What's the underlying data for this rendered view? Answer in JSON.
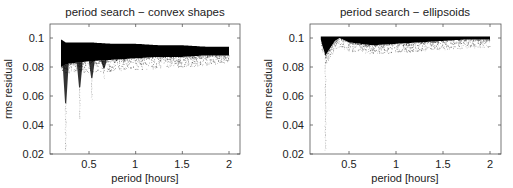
{
  "chart_data": [
    {
      "type": "scatter",
      "title": "period search − convex shapes",
      "xlabel": "period [hours]",
      "ylabel": "rms residual",
      "xlim": [
        0.08,
        2.12
      ],
      "ylim": [
        0.02,
        0.11
      ],
      "xticks": [
        0.5,
        1,
        1.5,
        2
      ],
      "xtick_labels": [
        "0.5",
        "1",
        "1.5",
        "2"
      ],
      "yticks": [
        0.02,
        0.04,
        0.06,
        0.08,
        0.1
      ],
      "ytick_labels": [
        "0.02",
        "0.04",
        "0.06",
        "0.08",
        "0.1"
      ],
      "grid": false,
      "legend": null,
      "marker_color": "#000000",
      "description": "Dense band of points from period 0.2 to 2 h; upper envelope ~0.099 at 0.2 h decreasing to ~0.094 at 2 h; lower edge of dense band ~0.08 at short periods rising to ~0.088 at 2 h; sparse scatter down to ~0.078 along the band; vertical dips (spikes) toward lower rms at ~0.25 h (down to ~0.022), ~0.4 h (~0.045), ~0.52 h (~0.058) and ~0.65 h (~0.072).",
      "band": {
        "x": [
          0.2,
          0.25,
          0.5,
          0.75,
          1.0,
          1.25,
          1.5,
          1.75,
          2.0
        ],
        "upper": [
          0.099,
          0.097,
          0.097,
          0.096,
          0.096,
          0.095,
          0.095,
          0.094,
          0.094
        ],
        "lower": [
          0.08,
          0.082,
          0.084,
          0.085,
          0.086,
          0.087,
          0.087,
          0.088,
          0.088
        ]
      },
      "sparse_floor": [
        0.078,
        0.078,
        0.078,
        0.079,
        0.08,
        0.081,
        0.082,
        0.083,
        0.085
      ],
      "dips": [
        {
          "x": 0.25,
          "min": 0.022
        },
        {
          "x": 0.4,
          "min": 0.045
        },
        {
          "x": 0.53,
          "min": 0.058
        },
        {
          "x": 0.66,
          "min": 0.072
        }
      ]
    },
    {
      "type": "scatter",
      "title": "period search − ellipsoids",
      "xlabel": "period [hours]",
      "ylabel": "rms residual",
      "xlim": [
        0.08,
        2.12
      ],
      "ylim": [
        0.02,
        0.11
      ],
      "xticks": [
        0.5,
        1,
        1.5,
        2
      ],
      "xtick_labels": [
        "0.5",
        "1",
        "1.5",
        "2"
      ],
      "yticks": [
        0.02,
        0.04,
        0.06,
        0.08,
        0.1
      ],
      "ytick_labels": [
        "0.02",
        "0.04",
        "0.06",
        "0.08",
        "0.1"
      ],
      "grid": false,
      "legend": null,
      "marker_color": "#000000",
      "description": "Dense band hugging rms ~0.1 from 0.2 to 2 h; deep narrow dip at ~0.25 h down to ~0.088 (with sparse points to ~0.022); band upper edge ~0.101; lower edge ~0.096 around 0.5-1.0 h converging to ~0.099 at 2 h.",
      "band": {
        "x": [
          0.2,
          0.22,
          0.25,
          0.3,
          0.35,
          0.4,
          0.5,
          0.75,
          1.0,
          1.25,
          1.5,
          1.75,
          2.0
        ],
        "upper": [
          0.101,
          0.101,
          0.101,
          0.101,
          0.101,
          0.101,
          0.101,
          0.101,
          0.101,
          0.101,
          0.101,
          0.101,
          0.101
        ],
        "lower": [
          0.099,
          0.094,
          0.088,
          0.093,
          0.098,
          0.1,
          0.097,
          0.095,
          0.096,
          0.097,
          0.098,
          0.099,
          0.099
        ]
      },
      "dips": [
        {
          "x": 0.25,
          "min": 0.022
        }
      ]
    }
  ]
}
